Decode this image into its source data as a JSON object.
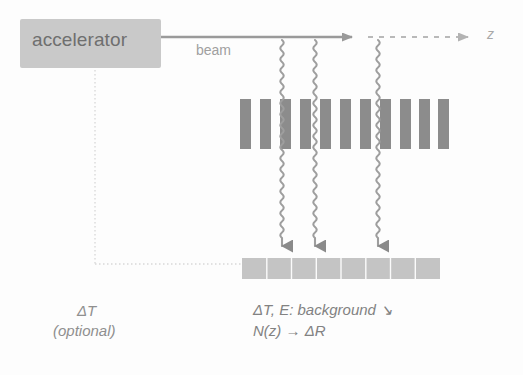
{
  "figure": {
    "background_color": "#fdfdfd"
  },
  "accelerator": {
    "label": "accelerator",
    "box_color": "#c9c9c9",
    "text_color": "#6f6f6f",
    "x": 20,
    "y": 19,
    "width": 141,
    "height": 49
  },
  "beam": {
    "label": "beam",
    "axis_label": "z",
    "line_color": "#9a9a9a",
    "dashed_color": "#b9b9b9",
    "y": 37,
    "solid_from_x": 161,
    "solid_to_x": 362,
    "dashed_from_x": 368,
    "dashed_to_x": 478
  },
  "grating": {
    "name": "chopper-grating",
    "bar_color": "#8c8c8c",
    "bar_count": 11,
    "bar_width": 11,
    "gap": 9,
    "x_start": 240,
    "y": 99,
    "height": 50
  },
  "detector": {
    "name": "segmented-detector",
    "fill_color": "#c4c4c4",
    "segment_count": 8,
    "x": 242,
    "y": 258,
    "width": 198,
    "height": 21
  },
  "rays": {
    "color": "#9e9e9e",
    "arrow_color": "#8a8a8a",
    "x_positions": [
      282,
      315,
      378
    ],
    "y_top": 40,
    "y_bottom": 258,
    "amplitude": 3.2,
    "wavelength": 11
  },
  "optional_path": {
    "label_line1": "ΔT",
    "label_line2": "(optional)",
    "dotted_color": "#d7d7d7",
    "vertical_x": 95,
    "vertical_from_y": 70,
    "vertical_to_y": 264,
    "horizontal_to_x": 242,
    "horizontal_y": 264
  },
  "annotations": {
    "line1": "ΔT, E: background ↘",
    "line2": "N(z) → ΔR",
    "text_color": "#828282"
  }
}
